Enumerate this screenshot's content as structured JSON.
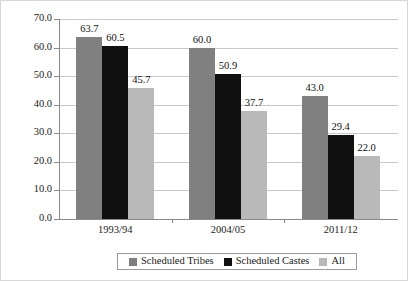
{
  "chart_data": {
    "type": "bar",
    "title": "",
    "subtitle": "",
    "xlabel": "",
    "ylabel": "",
    "categories": [
      "1993/94",
      "2004/05",
      "2011/12"
    ],
    "series": [
      {
        "name": "Scheduled Tribes",
        "color": "#808080",
        "values": [
          63.7,
          60.0,
          43.0
        ]
      },
      {
        "name": "Scheduled Castes",
        "color": "#101010",
        "values": [
          60.5,
          50.9,
          29.4
        ]
      },
      {
        "name": "All",
        "color": "#b9b9b9",
        "values": [
          45.7,
          37.7,
          22.0
        ]
      }
    ],
    "value_labels": [
      [
        "63.7",
        "60.5",
        "45.7"
      ],
      [
        "60.0",
        "50.9",
        "37.7"
      ],
      [
        "43.0",
        "29.4",
        "22.0"
      ]
    ],
    "ylim": [
      0,
      70
    ],
    "ytick_labels": [
      "0.0",
      "10.0",
      "20.0",
      "30.0",
      "40.0",
      "50.0",
      "60.0",
      "70.0"
    ],
    "ytick_values": [
      0,
      10,
      20,
      30,
      40,
      50,
      60,
      70
    ],
    "grid": true,
    "grid_axis": "y",
    "legend_position": "bottom",
    "legend_entries": [
      "Scheduled Tribes",
      "Scheduled Castes",
      "All"
    ]
  },
  "axis": {
    "y": {
      "ticks": [
        {
          "label": "70.0"
        },
        {
          "label": "60.0"
        },
        {
          "label": "50.0"
        },
        {
          "label": "40.0"
        },
        {
          "label": "30.0"
        },
        {
          "label": "20.0"
        },
        {
          "label": "10.0"
        },
        {
          "label": "0.0"
        }
      ]
    },
    "x": {
      "ticks": [
        {
          "label": "1993/94"
        },
        {
          "label": "2004/05"
        },
        {
          "label": "2011/12"
        }
      ]
    }
  },
  "legend": {
    "items": [
      {
        "label": "Scheduled Tribes",
        "color": "#808080"
      },
      {
        "label": "Scheduled Castes",
        "color": "#101010"
      },
      {
        "label": "All",
        "color": "#b9b9b9"
      }
    ]
  }
}
